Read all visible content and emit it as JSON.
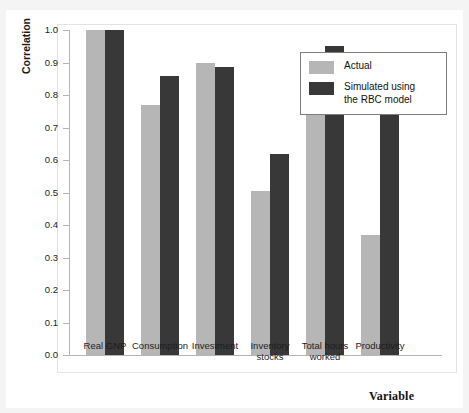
{
  "chart_data": {
    "type": "bar",
    "title": "",
    "xlabel": "Variable",
    "ylabel": "Correlation",
    "ylim": [
      0.0,
      1.0
    ],
    "ytick_step": 0.1,
    "ytick_labels": [
      "1.0",
      "0.9",
      "0.8",
      "0.7",
      "0.6",
      "0.5",
      "0.4",
      "0.3",
      "0.2",
      "0.1",
      "0.0"
    ],
    "ytick_values": [
      1.0,
      0.9,
      0.8,
      0.7,
      0.6,
      0.5,
      0.4,
      0.3,
      0.2,
      0.1,
      0.0
    ],
    "grid": false,
    "legend_position": "top-right",
    "categories": [
      "Real GNP",
      "Consumption",
      "Investment",
      "Inventory\nstocks",
      "Total hours\nworked",
      "Productivity"
    ],
    "series": [
      {
        "name": "Actual",
        "color": "#b6b6b6",
        "values": [
          1.0,
          0.77,
          0.9,
          0.505,
          0.855,
          0.37
        ]
      },
      {
        "name": "Simulated using\nthe RBC model",
        "color": "#383838",
        "values": [
          1.0,
          0.86,
          0.885,
          0.62,
          0.95,
          0.865
        ]
      }
    ]
  },
  "legend": {
    "items": [
      {
        "label": "Actual",
        "color": "#b6b6b6"
      },
      {
        "label": "Simulated using\nthe RBC model",
        "color": "#383838"
      }
    ]
  }
}
